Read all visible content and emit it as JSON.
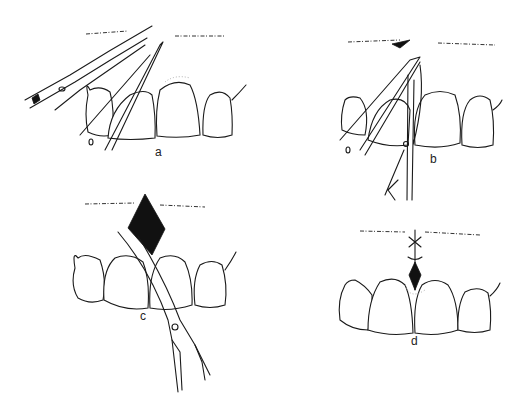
{
  "figure": {
    "panels": [
      {
        "id": "a",
        "label": "a",
        "description": "Tissue held with forceps while curved scissors incise interdental papilla"
      },
      {
        "id": "b",
        "label": "b",
        "description": "Scissors cutting tissue held by forceps between central incisors"
      },
      {
        "id": "c",
        "label": "c",
        "description": "Diamond-shaped excision of frenum with curved scissors"
      },
      {
        "id": "d",
        "label": "d",
        "description": "Sutured wound after frenectomy"
      }
    ],
    "colors": {
      "line": "#1a1a1a",
      "background": "#ffffff"
    }
  }
}
